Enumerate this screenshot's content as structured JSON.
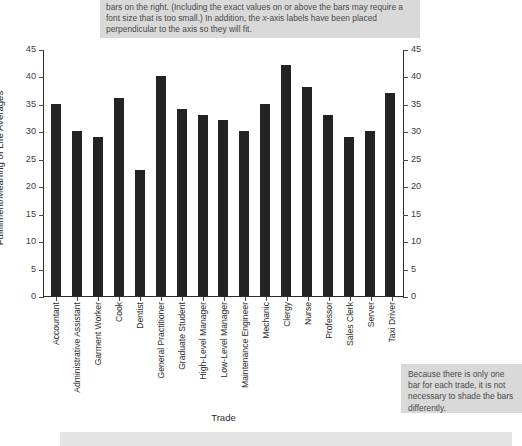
{
  "callouts": {
    "top": "bars on the right. (Including the exact values on or above the bars may require a font size that is too small.) In addition, the x-axis labels have been placed perpendicular to the axis so they will fit.",
    "right": "Because there is only one bar for each trade, it is not necessary to shade the bars differently.",
    "bottom": ""
  },
  "chart_data": {
    "type": "bar",
    "title": "",
    "xlabel": "Trade",
    "ylabel": "Fulfillment/Meaning of Life Averages",
    "ylim": [
      0,
      45
    ],
    "yticks": [
      0,
      5,
      10,
      15,
      20,
      25,
      30,
      35,
      40,
      45
    ],
    "grid": false,
    "legend": false,
    "dual_y_axis": true,
    "bar_color": "#232323",
    "categories": [
      "Accountant",
      "Administrative Assistant",
      "Garment Worker",
      "Cook",
      "Dentist",
      "General Practitioner",
      "Graduate Student",
      "High-Level Manager",
      "Low-Level Manager",
      "Maintenance Engineer",
      "Mechanic",
      "Clergy",
      "Nurse",
      "Professor",
      "Sales Clerk",
      "Server",
      "Taxi Driver"
    ],
    "values": [
      35,
      30,
      29,
      36,
      23,
      40,
      34,
      33,
      32,
      30,
      35,
      42,
      38,
      33,
      29,
      30,
      37
    ]
  }
}
